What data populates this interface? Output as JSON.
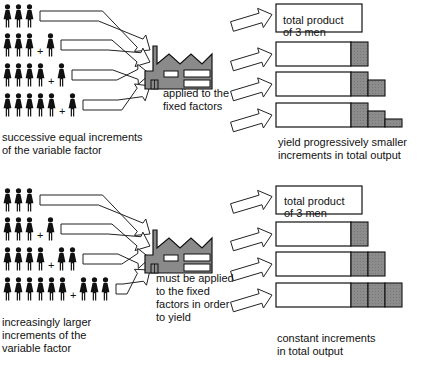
{
  "panels": [
    {
      "id": "diminishing",
      "rows": [
        {
          "base_men": 3,
          "added_men": 0
        },
        {
          "base_men": 3,
          "added_men": 1
        },
        {
          "base_men": 4,
          "added_men": 1
        },
        {
          "base_men": 5,
          "added_men": 1
        }
      ],
      "plus_symbol": "+",
      "left_caption_line1": "successive equal increments",
      "left_caption_line2": "of the variable factor",
      "middle_caption_line1": "applied to the",
      "middle_caption_line2": "fixed factors",
      "box_label_line1": "total product",
      "box_label_line2": "of 3 men",
      "bars": [
        {
          "increments": []
        },
        {
          "increments": [
            1.0
          ]
        },
        {
          "increments": [
            1.0,
            0.95
          ]
        },
        {
          "increments": [
            1.0,
            0.95,
            0.85
          ]
        }
      ],
      "right_caption_line1": "yield progressively smaller",
      "right_caption_line2": "increments in total output"
    },
    {
      "id": "constant",
      "rows": [
        {
          "base_men": 3,
          "added_men": 0
        },
        {
          "base_men": 3,
          "added_men": 1
        },
        {
          "base_men": 4,
          "added_men": 2
        },
        {
          "base_men": 6,
          "added_men": 3
        }
      ],
      "plus_symbol": "+",
      "left_caption_line1": "increasingly larger",
      "left_caption_line2": "increments of the",
      "left_caption_line3": "variable factor",
      "middle_caption_line1": "must be applied",
      "middle_caption_line2": "to the fixed",
      "middle_caption_line3": "factors in order",
      "middle_caption_line4": "to yield",
      "box_label_line1": "total product",
      "box_label_line2": "of 3 men",
      "bars": [
        {
          "increments": []
        },
        {
          "increments": [
            1
          ]
        },
        {
          "increments": [
            1,
            1
          ]
        },
        {
          "increments": [
            1,
            1,
            1
          ]
        }
      ],
      "right_caption_line1": "constant increments",
      "right_caption_line2": "in total output"
    }
  ],
  "colors": {
    "ink": "#111111",
    "factory_fill": "#8a8a8a",
    "increment_fill": "#8c8c8c",
    "background": "#ffffff"
  },
  "icons": {
    "person": "person-icon",
    "factory": "factory-icon",
    "arrow": "hollow-arrow-icon"
  }
}
